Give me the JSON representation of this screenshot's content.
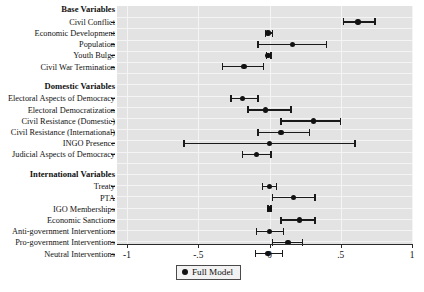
{
  "chart_data": {
    "type": "scatter",
    "title": "",
    "xlabel": "",
    "ylabel": "",
    "xlim": [
      -1,
      1
    ],
    "xticks": [
      -1,
      -0.5,
      0,
      0.5,
      1
    ],
    "xticklabels": [
      "-1",
      "-.5",
      "0",
      ".5",
      "1"
    ],
    "grid": true,
    "legend": {
      "position": "bottom-center",
      "entries": [
        "Full Model"
      ]
    },
    "reference_line": {
      "x": 0,
      "style": "dashed"
    },
    "groups": [
      {
        "header": "Base Variables",
        "rows": [
          {
            "label": "Civil Conflict",
            "estimate": 0.62,
            "lower": 0.52,
            "upper": 0.74
          },
          {
            "label": "Economic Development",
            "estimate": -0.01,
            "lower": -0.03,
            "upper": 0.02
          },
          {
            "label": "Population",
            "estimate": 0.16,
            "lower": -0.08,
            "upper": 0.4
          },
          {
            "label": "Youth Bulge",
            "estimate": -0.01,
            "lower": -0.02,
            "upper": 0.01
          },
          {
            "label": "Civil War Termination",
            "estimate": -0.18,
            "lower": -0.33,
            "upper": -0.04
          }
        ]
      },
      {
        "header": "Domestic Variables",
        "rows": [
          {
            "label": "Electoral Aspects of Democracy",
            "estimate": -0.19,
            "lower": -0.27,
            "upper": -0.08
          },
          {
            "label": "Electoral Democratization",
            "estimate": -0.03,
            "lower": -0.15,
            "upper": 0.15
          },
          {
            "label": "Civil Resistance (Domestic)",
            "estimate": 0.31,
            "lower": 0.08,
            "upper": 0.5
          },
          {
            "label": "Civil Resistance (International)",
            "estimate": 0.08,
            "lower": -0.08,
            "upper": 0.28
          },
          {
            "label": "INGO Presence",
            "estimate": 0.0,
            "lower": -0.6,
            "upper": 0.6
          },
          {
            "label": "Judicial Aspects of Democracy",
            "estimate": -0.09,
            "lower": -0.19,
            "upper": 0.01
          }
        ]
      },
      {
        "header": "International Variables",
        "rows": [
          {
            "label": "Treaty",
            "estimate": 0.0,
            "lower": -0.05,
            "upper": 0.05
          },
          {
            "label": "PTA",
            "estimate": 0.17,
            "lower": 0.02,
            "upper": 0.32
          },
          {
            "label": "IGO Memberships",
            "estimate": 0.0,
            "lower": -0.01,
            "upper": 0.01
          },
          {
            "label": "Economic Sanctions",
            "estimate": 0.21,
            "lower": 0.08,
            "upper": 0.32
          },
          {
            "label": "Anti-government Interventions",
            "estimate": 0.0,
            "lower": -0.09,
            "upper": 0.1
          },
          {
            "label": "Pro-government Interventions",
            "estimate": 0.13,
            "lower": 0.02,
            "upper": 0.23
          },
          {
            "label": "Neutral Interventions",
            "estimate": -0.01,
            "lower": -0.1,
            "upper": 0.09
          }
        ]
      }
    ]
  },
  "legend": {
    "label": "Full Model",
    "marker": "filled-circle"
  }
}
